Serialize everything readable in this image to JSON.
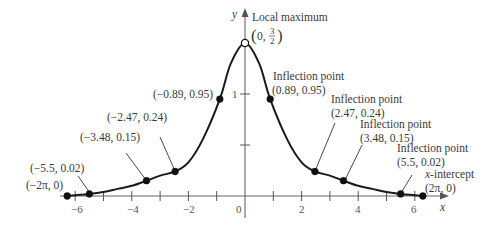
{
  "chart_data": {
    "type": "line",
    "title": "",
    "xlabel": "x",
    "ylabel": "y",
    "xlim": [
      -6.6,
      7.2
    ],
    "ylim": [
      -0.4,
      1.85
    ],
    "grid": false,
    "x_ticks": [
      -6,
      -5,
      -4,
      -3,
      -2,
      -1,
      0,
      1,
      2,
      3,
      4,
      5,
      6
    ],
    "x_tick_labels": [
      {
        "value": -6,
        "label": "−6"
      },
      {
        "value": -4,
        "label": "−4"
      },
      {
        "value": -2,
        "label": "−2"
      },
      {
        "value": 0,
        "label": "0"
      },
      {
        "value": 2,
        "label": "2"
      },
      {
        "value": 4,
        "label": "4"
      },
      {
        "value": 6,
        "label": "6"
      }
    ],
    "y_ticks": [
      0.5,
      1
    ],
    "y_tick_labels": [
      {
        "value": 1,
        "label": "1"
      }
    ],
    "series": [
      {
        "name": "f(x)",
        "x": [
          -6.283,
          -6.0,
          -5.5,
          -5.0,
          -4.5,
          -4.0,
          -3.48,
          -3.0,
          -2.47,
          -2.0,
          -1.5,
          -0.89,
          -0.5,
          0,
          0.5,
          0.89,
          1.5,
          2.0,
          2.47,
          3.0,
          3.48,
          4.0,
          4.5,
          5.0,
          5.5,
          6.0,
          6.283
        ],
        "y": [
          0,
          0.008,
          0.02,
          0.04,
          0.07,
          0.1,
          0.15,
          0.2,
          0.24,
          0.33,
          0.55,
          0.95,
          1.3,
          1.5,
          1.3,
          0.95,
          0.55,
          0.33,
          0.24,
          0.2,
          0.15,
          0.1,
          0.07,
          0.04,
          0.02,
          0.008,
          0
        ]
      }
    ],
    "points": [
      {
        "x": -6.283,
        "y": 0,
        "label": "(−2π, 0)",
        "open": false
      },
      {
        "x": -5.5,
        "y": 0.02,
        "label": "(−5.5, 0.02)",
        "open": false
      },
      {
        "x": -3.48,
        "y": 0.15,
        "label": "(−3.48, 0.15)",
        "open": false
      },
      {
        "x": -2.47,
        "y": 0.24,
        "label": "(−2.47, 0.24)",
        "open": false
      },
      {
        "x": -0.89,
        "y": 0.95,
        "label": "(−0.89, 0.95)",
        "open": false
      },
      {
        "x": 0,
        "y": 1.5,
        "label": "(0, 3/2)",
        "open": true
      },
      {
        "x": 0.89,
        "y": 0.95,
        "label": "(0.89, 0.95)",
        "open": false
      },
      {
        "x": 2.47,
        "y": 0.24,
        "label": "(2.47, 0.24)",
        "open": false
      },
      {
        "x": 3.48,
        "y": 0.15,
        "label": "(3.48, 0.15)",
        "open": false
      },
      {
        "x": 5.5,
        "y": 0.02,
        "label": "(5.5, 0.02)",
        "open": false
      },
      {
        "x": 6.283,
        "y": 0,
        "label": "(2π, 0)",
        "open": false
      }
    ],
    "annotations": [
      {
        "text": "Local maximum",
        "target": [
          0,
          1.5
        ]
      },
      {
        "text": "Inflection point",
        "target": [
          0.89,
          0.95
        ]
      },
      {
        "text": "Inflection point",
        "target": [
          2.47,
          0.24
        ]
      },
      {
        "text": "Inflection point",
        "target": [
          3.48,
          0.15
        ]
      },
      {
        "text": "Inflection point",
        "target": [
          5.5,
          0.02
        ]
      },
      {
        "text": "x-intercept",
        "target": [
          6.283,
          0
        ]
      }
    ]
  },
  "labels": {
    "y_axis": "y",
    "x_axis": "x",
    "local_max": "Local maximum",
    "local_max_coord_prefix": "(0, ",
    "local_max_frac_num": "3",
    "local_max_frac_den": "2",
    "local_max_coord_suffix": ")",
    "inflection": "Inflection point",
    "pt_089": "(0.89, 0.95)",
    "pt_247": "(2.47, 0.24)",
    "pt_348": "(3.48, 0.15)",
    "pt_55": "(5.5, 0.02)",
    "x_intercept_var": "x",
    "x_intercept_rest": "-intercept",
    "pt_2pi": "(2π, 0)",
    "pt_m089": "(−0.89, 0.95)",
    "pt_m247": "(−2.47, 0.24)",
    "pt_m348": "(−3.48, 0.15)",
    "pt_m55": "(−5.5, 0.02)",
    "pt_m2pi": "(−2π, 0)",
    "tick_m6": "−6",
    "tick_m4": "−4",
    "tick_m2": "−2",
    "tick_0": "0",
    "tick_2": "2",
    "tick_4": "4",
    "tick_6": "6",
    "tick_y1": "1"
  }
}
